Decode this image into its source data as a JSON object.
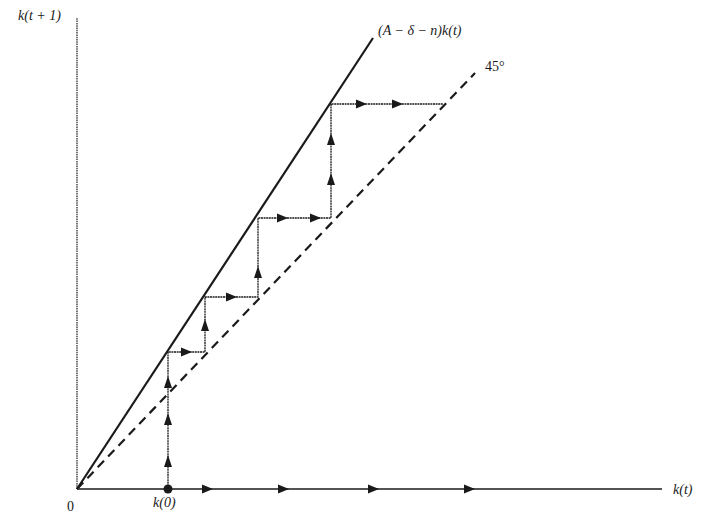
{
  "figure": {
    "type": "phase-diagram",
    "y_axis_label": "k(t + 1)",
    "x_axis_label": "k(t)",
    "origin_label": "0",
    "initial_point_label": "k(0)",
    "line_label": "(A − δ − n)k(t)",
    "diagonal_label": "45°",
    "colors": {
      "ink": "#1a1a1a",
      "background": "#ffffff"
    }
  },
  "geometry": {
    "origin": [
      77,
      489
    ],
    "y_axis_top": 18,
    "x_axis_right": 662,
    "growth_line_end": [
      373,
      38
    ],
    "diagonal_end": [
      475,
      73
    ],
    "k0": [
      168,
      489
    ],
    "staircase": [
      [
        168,
        489
      ],
      [
        168,
        352
      ],
      [
        205,
        352
      ],
      [
        205,
        297
      ],
      [
        258,
        297
      ],
      [
        258,
        218
      ],
      [
        331,
        218
      ],
      [
        331,
        104
      ],
      [
        443,
        104
      ]
    ],
    "x_axis_arrows": [
      207,
      283,
      373,
      469
    ],
    "staircase_arrows": [
      {
        "x": 168,
        "y": 462,
        "dir": "up"
      },
      {
        "x": 168,
        "y": 420,
        "dir": "up"
      },
      {
        "x": 168,
        "y": 383,
        "dir": "up"
      },
      {
        "x": 186,
        "y": 352,
        "dir": "right"
      },
      {
        "x": 205,
        "y": 326,
        "dir": "up"
      },
      {
        "x": 231,
        "y": 297,
        "dir": "right"
      },
      {
        "x": 258,
        "y": 273,
        "dir": "up"
      },
      {
        "x": 282,
        "y": 218,
        "dir": "right"
      },
      {
        "x": 315,
        "y": 218,
        "dir": "right"
      },
      {
        "x": 331,
        "y": 180,
        "dir": "up"
      },
      {
        "x": 331,
        "y": 140,
        "dir": "up"
      },
      {
        "x": 361,
        "y": 104,
        "dir": "right"
      },
      {
        "x": 397,
        "y": 104,
        "dir": "right"
      }
    ]
  }
}
